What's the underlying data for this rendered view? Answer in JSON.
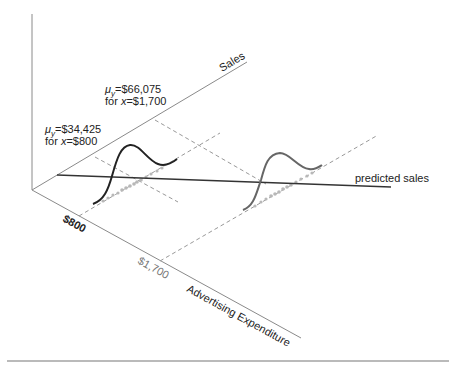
{
  "diagram": {
    "type": "3d-regression-distribution-diagram",
    "axes": {
      "vertical": {
        "label": ""
      },
      "sales": {
        "label": "Sales"
      },
      "advertising": {
        "label": "Advertising Expenditure"
      }
    },
    "ticks": {
      "x800": "$800",
      "x1700": "$1,700"
    },
    "annotations": {
      "mean800": {
        "line1_mu": "μ",
        "line1_sub": "y",
        "line1_rest": "=$34,425",
        "line2_pre": "for ",
        "line2_var": "x",
        "line2_rest": "=$800"
      },
      "mean1700": {
        "line1_mu": "μ",
        "line1_sub": "y",
        "line1_rest": "=$66,075",
        "line2_pre": "for ",
        "line2_var": "x",
        "line2_rest": "=$1,700"
      }
    },
    "regression_line_label": "predicted sales",
    "colors": {
      "axis": "#888888",
      "dashed": "#999999",
      "curve_800": "#222222",
      "curve_1700": "#666666",
      "regression": "#333333",
      "dots": "#bbbbbb",
      "rule": "#777777"
    }
  }
}
